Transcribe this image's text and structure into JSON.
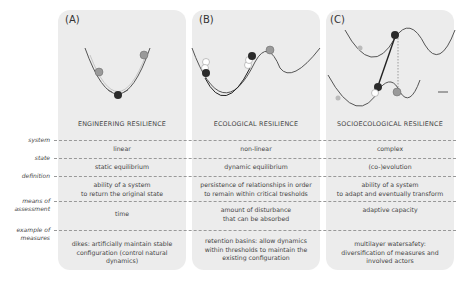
{
  "panels": [
    {
      "id": "A",
      "label": "(A)",
      "title": "ENGINEERING RESILIENCE",
      "system": "linear",
      "state": "static equilibrium",
      "definition": "ability of a system\nto return the original state",
      "means": "time",
      "example": "dikes: artificially maintain stable\nconfiguration (control natural\ndynamics)"
    },
    {
      "id": "B",
      "label": "(B)",
      "title": "ECOLOGICAL RESILIENCE",
      "system": "non-linear",
      "state": "dynamic equilibrium",
      "definition": "persistence of relationships in order\nto remain within critical tresholds",
      "means": "amount of disturbance\nthat can be absorbed",
      "example": "retention basins: allow dynamics\nwithin thresholds to maintain the\nexisting configuration"
    },
    {
      "id": "C",
      "label": "(C)",
      "title": "SOCIOECOLOGICAL RESILIENCE",
      "system": "complex",
      "state": "(co-)evolution",
      "definition": "ability of a system\nto adapt and eventually transform",
      "means": "adaptive capacity",
      "example": "multilayer watersafety:\ndiversification of measures and\ninvolved actors"
    }
  ],
  "row_labels": {
    "system": "system",
    "state": "state",
    "definition": "definition",
    "means": "means of\nassessment",
    "example": "example of\nmeasures"
  },
  "colors": {
    "panel_bg": "#ececec",
    "ball_dark": "#2b2b2b",
    "ball_grey": "#9a9a9a",
    "ball_light": "#ffffff",
    "curve": "#555555"
  }
}
